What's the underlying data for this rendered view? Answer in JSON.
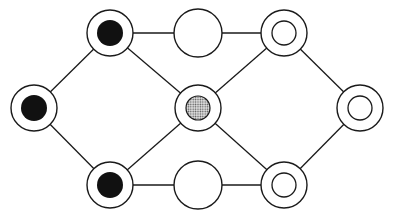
{
  "diagram": {
    "type": "graph",
    "colors": {
      "stroke": "#1a1a1a",
      "filled": "#111111",
      "dotted": "#9a9a9a",
      "background": "#ffffff"
    },
    "nodes": [
      {
        "id": "left",
        "x": 34,
        "y": 108,
        "style": "ring-filled"
      },
      {
        "id": "top-left",
        "x": 110,
        "y": 33,
        "style": "ring-filled"
      },
      {
        "id": "bottom-left",
        "x": 110,
        "y": 185,
        "style": "ring-filled"
      },
      {
        "id": "top-middle",
        "x": 198,
        "y": 33,
        "style": "plain"
      },
      {
        "id": "center",
        "x": 198,
        "y": 108,
        "style": "ring-dotted"
      },
      {
        "id": "bottom-middle",
        "x": 198,
        "y": 185,
        "style": "plain"
      },
      {
        "id": "top-right",
        "x": 284,
        "y": 33,
        "style": "ring-open"
      },
      {
        "id": "bottom-right",
        "x": 284,
        "y": 185,
        "style": "ring-open"
      },
      {
        "id": "right",
        "x": 360,
        "y": 108,
        "style": "ring-open"
      }
    ],
    "edges": [
      [
        "left",
        "top-left"
      ],
      [
        "left",
        "bottom-left"
      ],
      [
        "top-left",
        "top-middle"
      ],
      [
        "top-middle",
        "top-right"
      ],
      [
        "top-left",
        "center"
      ],
      [
        "bottom-left",
        "center"
      ],
      [
        "center",
        "top-right"
      ],
      [
        "center",
        "bottom-right"
      ],
      [
        "bottom-left",
        "bottom-middle"
      ],
      [
        "bottom-middle",
        "bottom-right"
      ],
      [
        "top-right",
        "right"
      ],
      [
        "bottom-right",
        "right"
      ]
    ]
  }
}
